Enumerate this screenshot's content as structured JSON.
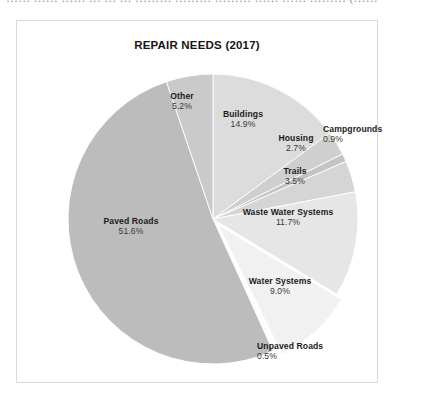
{
  "page": {
    "top_cut_text": "…… …… …… … … … ……… ……… ……… …… …… ……… (……"
  },
  "chart_data": {
    "type": "pie",
    "title": "REPAIR NEEDS (2017)",
    "xlabel": "",
    "ylabel": "",
    "legend": "none",
    "labels_position": "inside-and-outside",
    "units": "percent",
    "start_angle_deg": 0,
    "direction": "clockwise",
    "categories": [
      "Buildings",
      "Housing",
      "Campgrounds",
      "Trails",
      "Waste Water Systems",
      "Water Systems",
      "Unpaved Roads",
      "Paved Roads",
      "Other"
    ],
    "values": [
      14.9,
      2.7,
      0.9,
      3.5,
      11.7,
      9.0,
      0.5,
      51.6,
      5.2
    ],
    "value_labels": [
      "14.9%",
      "2.7%",
      "0.9%",
      "3.5%",
      "11.7%",
      "9.0%",
      "0.5%",
      "51.6%",
      "5.2%"
    ],
    "colors": [
      "#dcdcdc",
      "#cfcfcf",
      "#c4c4c4",
      "#d5d5d5",
      "#e6e6e6",
      "#f1f1f1",
      "#fbfbfb",
      "#bcbcbc",
      "#cacaca"
    ],
    "exploded_slices": [
      "Water Systems",
      "Unpaved Roads"
    ],
    "slices": [
      {
        "name": "Buildings",
        "pct": "14.9%",
        "color": "#dcdcdc"
      },
      {
        "name": "Housing",
        "pct": "2.7%",
        "color": "#cfcfcf"
      },
      {
        "name": "Campgrounds",
        "pct": "0.9%",
        "color": "#c4c4c4"
      },
      {
        "name": "Trails",
        "pct": "3.5%",
        "color": "#d5d5d5"
      },
      {
        "name": "Waste Water Systems",
        "pct": "11.7%",
        "color": "#e6e6e6"
      },
      {
        "name": "Water Systems",
        "pct": "9.0%",
        "color": "#f1f1f1"
      },
      {
        "name": "Unpaved Roads",
        "pct": "0.5%",
        "color": "#fbfbfb"
      },
      {
        "name": "Paved Roads",
        "pct": "51.6%",
        "color": "#bcbcbc"
      },
      {
        "name": "Other",
        "pct": "5.2%",
        "color": "#cacaca"
      }
    ]
  }
}
